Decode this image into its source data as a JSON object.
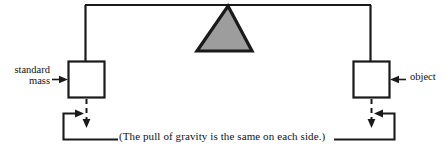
{
  "diagram": {
    "colors": {
      "stroke": "#1a1a1a",
      "fulcrum_fill": "#9d9d9d",
      "background": "#ffffff"
    },
    "labels": {
      "left_label_line1": "standard",
      "left_label_line2": "mass",
      "right_label": "object",
      "caption": "(The pull of gravity is the same on each side.)"
    },
    "parts": {
      "beam": "horizontal-beam",
      "fulcrum": "triangle-fulcrum",
      "left_pan": "left-mass-box",
      "right_pan": "right-object-box",
      "left_force_arrow": "dashed-down-arrow-left",
      "right_force_arrow": "dashed-down-arrow-right",
      "left_bracket": "left-caption-connector",
      "right_bracket": "right-caption-connector",
      "left_pointer": "arrow-pointing-right-to-left-box",
      "right_pointer": "arrow-pointing-left-to-right-box"
    }
  }
}
